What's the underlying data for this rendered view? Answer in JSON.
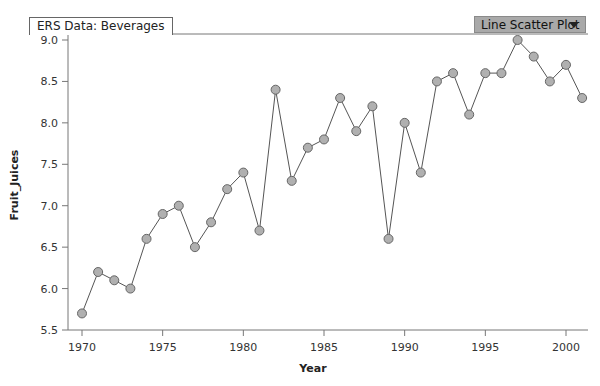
{
  "header": {
    "title": "ERS Data: Beverages",
    "plot_type_selected": "Line Scatter Plot",
    "dropdown_icon": "triangle-down-icon"
  },
  "chart_data": {
    "type": "line",
    "title": "ERS Data: Beverages",
    "xlabel": "Year",
    "ylabel": "Fruit_Juices",
    "xlim": [
      1969.5,
      2001.5
    ],
    "ylim": [
      5.5,
      9.0
    ],
    "x_ticks": [
      1970,
      1975,
      1980,
      1985,
      1990,
      1995,
      2000
    ],
    "x_tick_labels": [
      "1970",
      "1975",
      "1980",
      "1985",
      "1990",
      "1995",
      "2000"
    ],
    "y_ticks": [
      5.5,
      6.0,
      6.5,
      7.0,
      7.5,
      8.0,
      8.5,
      9.0
    ],
    "y_tick_labels": [
      "5.5",
      "6.0",
      "6.5",
      "7.0",
      "7.5",
      "8.0",
      "8.5",
      "9.0"
    ],
    "grid": false,
    "legend": "none",
    "marker_color": "#b0b0b0",
    "line_color": "#555555",
    "series": [
      {
        "name": "Fruit_Juices",
        "x": [
          1970,
          1971,
          1972,
          1973,
          1974,
          1975,
          1976,
          1977,
          1978,
          1979,
          1980,
          1981,
          1982,
          1983,
          1984,
          1985,
          1986,
          1987,
          1988,
          1989,
          1990,
          1991,
          1992,
          1993,
          1994,
          1995,
          1996,
          1997,
          1998,
          1999,
          2000,
          2001
        ],
        "y": [
          5.7,
          6.2,
          6.1,
          6.0,
          6.6,
          6.9,
          7.0,
          6.5,
          6.8,
          7.2,
          7.4,
          6.7,
          8.4,
          7.3,
          7.7,
          7.8,
          8.3,
          7.9,
          8.2,
          6.6,
          8.0,
          7.4,
          8.5,
          8.6,
          8.1,
          8.6,
          8.6,
          9.0,
          8.8,
          8.5,
          8.7,
          8.3
        ]
      }
    ]
  }
}
